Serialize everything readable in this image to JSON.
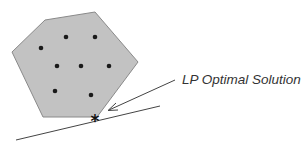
{
  "diagram": {
    "label": "LP Optimal Solution",
    "colors": {
      "region_fill": "#c2c2c2",
      "region_stroke": "#8a8a8a",
      "points": "#1a1a1a",
      "lines": "#444444",
      "star": "#111111"
    },
    "feasible_region_vertices": [
      [
        45,
        20
      ],
      [
        95,
        12
      ],
      [
        138,
        62
      ],
      [
        97,
        117
      ],
      [
        43,
        117
      ],
      [
        12,
        52
      ]
    ],
    "integer_points": [
      [
        41,
        48
      ],
      [
        66,
        37
      ],
      [
        95,
        37
      ],
      [
        57,
        66
      ],
      [
        81,
        66
      ],
      [
        109,
        66
      ],
      [
        55,
        91
      ],
      [
        91,
        95
      ]
    ],
    "optimal_point": [
      95,
      120
    ],
    "star_glyph": "*",
    "objective_line": [
      [
        16,
        140
      ],
      [
        160,
        106
      ]
    ],
    "pointer_line": [
      [
        175,
        80
      ],
      [
        109,
        110
      ]
    ]
  }
}
